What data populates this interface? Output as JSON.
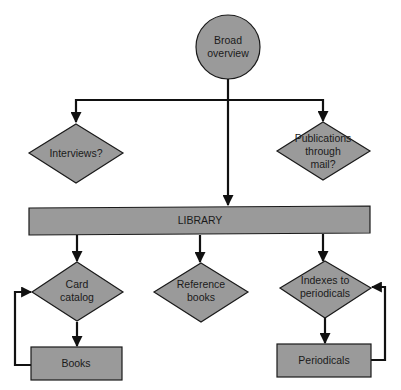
{
  "diagram": {
    "type": "flowchart",
    "colors": {
      "fill": "#9a9a9a",
      "stroke": "#1a1a1a",
      "line": "#111111",
      "background": "#ffffff"
    },
    "nodes": {
      "start": {
        "shape": "circle",
        "lines": [
          "Broad",
          "overview"
        ]
      },
      "interviews": {
        "shape": "diamond",
        "lines": [
          "Interviews?"
        ]
      },
      "publications": {
        "shape": "diamond",
        "lines": [
          "Publications",
          "through",
          "mail?"
        ]
      },
      "library": {
        "shape": "rectangle",
        "lines": [
          "LIBRARY"
        ]
      },
      "card_catalog": {
        "shape": "diamond",
        "lines": [
          "Card",
          "catalog"
        ]
      },
      "reference_books": {
        "shape": "diamond",
        "lines": [
          "Reference",
          "books"
        ]
      },
      "indexes": {
        "shape": "diamond",
        "lines": [
          "Indexes to",
          "periodicals"
        ]
      },
      "books": {
        "shape": "rectangle",
        "lines": [
          "Books"
        ]
      },
      "periodicals": {
        "shape": "rectangle",
        "lines": [
          "Periodicals"
        ]
      }
    },
    "edges": [
      {
        "from": "start",
        "to": "interviews"
      },
      {
        "from": "start",
        "to": "publications"
      },
      {
        "from": "start",
        "to": "library"
      },
      {
        "from": "library",
        "to": "card_catalog"
      },
      {
        "from": "library",
        "to": "reference_books"
      },
      {
        "from": "library",
        "to": "indexes"
      },
      {
        "from": "card_catalog",
        "to": "books"
      },
      {
        "from": "books",
        "to": "card_catalog"
      },
      {
        "from": "indexes",
        "to": "periodicals"
      },
      {
        "from": "periodicals",
        "to": "indexes"
      }
    ]
  }
}
